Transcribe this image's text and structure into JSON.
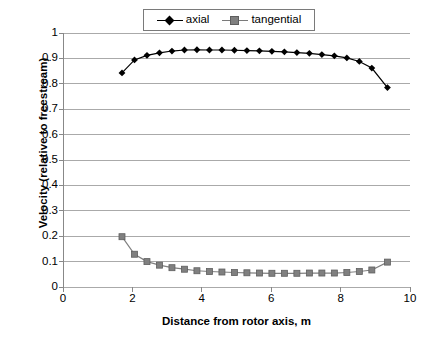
{
  "chart_data": {
    "type": "line",
    "title": "",
    "xlabel": "Distance from rotor axis, m",
    "ylabel": "Velocity (relative to freestream)",
    "xlim": [
      0,
      10
    ],
    "ylim": [
      0,
      1
    ],
    "xticks": [
      "0",
      "2",
      "4",
      "6",
      "8",
      "10"
    ],
    "xtick_values": [
      0,
      2,
      4,
      6,
      8,
      10
    ],
    "yticks": [
      "0",
      "0.1",
      "0.2",
      "0.3",
      "0.4",
      "0.5",
      "0.6",
      "0.7",
      "0.8",
      "0.9",
      "1"
    ],
    "ytick_values": [
      0,
      0.1,
      0.2,
      0.3,
      0.4,
      0.5,
      0.6,
      0.7,
      0.8,
      0.9,
      1
    ],
    "grid": "horizontal",
    "legend_position": "top-center",
    "x": [
      1.7,
      2.06,
      2.42,
      2.78,
      3.14,
      3.5,
      3.86,
      4.22,
      4.58,
      4.94,
      5.3,
      5.66,
      6.02,
      6.38,
      6.74,
      7.1,
      7.46,
      7.82,
      8.18,
      8.54,
      8.9,
      9.35
    ],
    "series": [
      {
        "name": "axial",
        "color": "#000000",
        "marker": "diamond",
        "values": [
          0.843,
          0.894,
          0.912,
          0.922,
          0.929,
          0.933,
          0.934,
          0.933,
          0.933,
          0.932,
          0.931,
          0.93,
          0.928,
          0.926,
          0.923,
          0.92,
          0.915,
          0.91,
          0.902,
          0.888,
          0.862,
          0.785
        ]
      },
      {
        "name": "tangential",
        "color": "#808080",
        "marker": "square",
        "values": [
          0.198,
          0.129,
          0.1,
          0.086,
          0.076,
          0.07,
          0.064,
          0.061,
          0.059,
          0.057,
          0.056,
          0.055,
          0.054,
          0.054,
          0.054,
          0.055,
          0.055,
          0.055,
          0.057,
          0.061,
          0.067,
          0.098
        ]
      }
    ]
  },
  "legend": {
    "items": [
      {
        "label": "axial"
      },
      {
        "label": "tangential"
      }
    ]
  }
}
